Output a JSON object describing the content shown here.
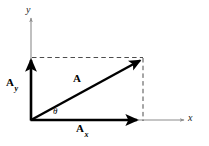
{
  "figure": {
    "kind": "vector-components-diagram",
    "width": 209,
    "height": 146,
    "background_color": "#ffffff",
    "axis_color": "#8c8c8c",
    "vector_color": "#000000",
    "dash_color": "#4d4d4d"
  },
  "labels": {
    "y_axis": "y",
    "x_axis": "x",
    "vector": "A",
    "component_y_base": "A",
    "component_y_sub": "y",
    "component_x_base": "A",
    "component_x_sub": "x",
    "angle": "θ"
  },
  "geometry": {
    "origin": {
      "x": 31,
      "y": 120
    },
    "vector_tip": {
      "x": 143,
      "y": 58
    },
    "x_component_tip": {
      "x": 140,
      "y": 120
    },
    "y_component_tip": {
      "x": 31,
      "y": 58
    },
    "x_axis_start": {
      "x": 31,
      "y": 120
    },
    "x_axis_end": {
      "x": 185,
      "y": 120
    },
    "y_axis_start": {
      "x": 31,
      "y": 120
    },
    "y_axis_end": {
      "x": 31,
      "y": 16
    }
  }
}
